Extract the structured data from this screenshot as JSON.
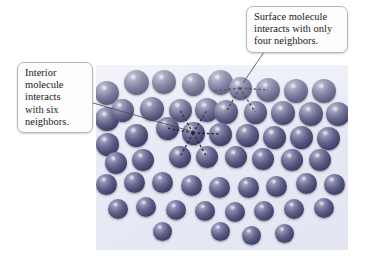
{
  "figure": {
    "background_color": "#ffffff",
    "panel": {
      "background_color": "#e8eaf4",
      "x": 96,
      "y": 65,
      "width": 252,
      "height": 185
    },
    "molecule": {
      "color": "#4a4c73",
      "highlight_color": "#b9bbd2",
      "shape": "sphere"
    }
  },
  "callouts": [
    {
      "id": "surface",
      "name": "surface-molecule-callout",
      "lines": [
        "Surface molecule",
        "interacts with only",
        "four neighbors."
      ],
      "text": "Surface molecule interacts with only four neighbors.",
      "neighbor_count": 4,
      "border_color": "#b9b9bd",
      "background_color": "#fdfdfd"
    },
    {
      "id": "interior",
      "name": "interior-molecule-callout",
      "lines": [
        "Interior",
        "molecule",
        "interacts",
        "with six",
        "neighbors."
      ],
      "text": "Interior molecule interacts with six neighbors.",
      "neighbor_count": 6,
      "border_color": "#b9b9bd",
      "background_color": "#fdfdfd"
    }
  ],
  "chart_data": {
    "type": "scatter",
    "xlabel": "",
    "ylabel": "",
    "grid": false,
    "legend": "none",
    "xlim": [
      0,
      252
    ],
    "ylim": [
      0,
      185
    ],
    "marker": "filled-sphere",
    "marker_color": "#4a4c73",
    "annotations": [
      {
        "label": "Surface molecule interacts with only four neighbors.",
        "target": [
          144,
          23
        ],
        "neighbors": 4
      },
      {
        "label": "Interior molecule interacts with six neighbors.",
        "target": [
          97,
          68
        ],
        "neighbors": 6
      }
    ],
    "highlighted_points": [
      {
        "role": "surface",
        "x": 144,
        "y": 23,
        "r": 11.5,
        "bonds": 4
      },
      {
        "role": "interior",
        "x": 97,
        "y": 68,
        "r": 11.5,
        "bonds": 6
      }
    ],
    "bonds": [
      {
        "from": [
          144,
          23
        ],
        "to": [
          117,
          26
        ]
      },
      {
        "from": [
          144,
          23
        ],
        "to": [
          172,
          25
        ]
      },
      {
        "from": [
          144,
          23
        ],
        "to": [
          130,
          47
        ]
      },
      {
        "from": [
          144,
          23
        ],
        "to": [
          159,
          47
        ]
      },
      {
        "from": [
          97,
          68
        ],
        "to": [
          71,
          63
        ]
      },
      {
        "from": [
          97,
          68
        ],
        "to": [
          124,
          69
        ]
      },
      {
        "from": [
          97,
          68
        ],
        "to": [
          84,
          45
        ]
      },
      {
        "from": [
          97,
          68
        ],
        "to": [
          111,
          45
        ]
      },
      {
        "from": [
          97,
          68
        ],
        "to": [
          84,
          92
        ]
      },
      {
        "from": [
          97,
          68
        ],
        "to": [
          111,
          92
        ]
      }
    ],
    "points": [
      {
        "x": 11,
        "y": 28,
        "r": 12
      },
      {
        "x": 40,
        "y": 17,
        "r": 12.5
      },
      {
        "x": 68,
        "y": 17,
        "r": 12
      },
      {
        "x": 97,
        "y": 19,
        "r": 11.5
      },
      {
        "x": 124,
        "y": 17,
        "r": 12.5
      },
      {
        "x": 144,
        "y": 23,
        "r": 11.5
      },
      {
        "x": 172,
        "y": 25,
        "r": 12
      },
      {
        "x": 200,
        "y": 26,
        "r": 12
      },
      {
        "x": 228,
        "y": 26,
        "r": 12
      },
      {
        "x": 11,
        "y": 54,
        "r": 12
      },
      {
        "x": 26,
        "y": 45,
        "r": 11.5
      },
      {
        "x": 56,
        "y": 44,
        "r": 12
      },
      {
        "x": 84,
        "y": 45,
        "r": 11.5
      },
      {
        "x": 111,
        "y": 45,
        "r": 12
      },
      {
        "x": 130,
        "y": 47,
        "r": 12
      },
      {
        "x": 159,
        "y": 47,
        "r": 11.5
      },
      {
        "x": 187,
        "y": 48,
        "r": 12
      },
      {
        "x": 215,
        "y": 49,
        "r": 12
      },
      {
        "x": 242,
        "y": 49,
        "r": 12
      },
      {
        "x": 11,
        "y": 79,
        "r": 11.5
      },
      {
        "x": 40,
        "y": 70,
        "r": 11.5
      },
      {
        "x": 71,
        "y": 63,
        "r": 11.5
      },
      {
        "x": 97,
        "y": 68,
        "r": 11.5
      },
      {
        "x": 124,
        "y": 69,
        "r": 11.5
      },
      {
        "x": 151,
        "y": 70,
        "r": 11.5
      },
      {
        "x": 178,
        "y": 72,
        "r": 11.5
      },
      {
        "x": 205,
        "y": 72,
        "r": 11.5
      },
      {
        "x": 232,
        "y": 73,
        "r": 11.5
      },
      {
        "x": 20,
        "y": 98,
        "r": 11
      },
      {
        "x": 47,
        "y": 95,
        "r": 11
      },
      {
        "x": 84,
        "y": 92,
        "r": 11
      },
      {
        "x": 111,
        "y": 92,
        "r": 11
      },
      {
        "x": 140,
        "y": 92,
        "r": 11
      },
      {
        "x": 167,
        "y": 94,
        "r": 11
      },
      {
        "x": 196,
        "y": 95,
        "r": 11
      },
      {
        "x": 224,
        "y": 95,
        "r": 11
      },
      {
        "x": 10,
        "y": 119,
        "r": 10.5
      },
      {
        "x": 38,
        "y": 117,
        "r": 10.5
      },
      {
        "x": 66,
        "y": 117,
        "r": 10.5
      },
      {
        "x": 95,
        "y": 120,
        "r": 10.5
      },
      {
        "x": 123,
        "y": 122,
        "r": 10.5
      },
      {
        "x": 152,
        "y": 122,
        "r": 10.5
      },
      {
        "x": 180,
        "y": 121,
        "r": 10.5
      },
      {
        "x": 210,
        "y": 118,
        "r": 10.5
      },
      {
        "x": 238,
        "y": 119,
        "r": 10.5
      },
      {
        "x": 22,
        "y": 144,
        "r": 10
      },
      {
        "x": 50,
        "y": 142,
        "r": 10
      },
      {
        "x": 80,
        "y": 145,
        "r": 10
      },
      {
        "x": 109,
        "y": 146,
        "r": 10
      },
      {
        "x": 139,
        "y": 147,
        "r": 10
      },
      {
        "x": 168,
        "y": 146,
        "r": 10
      },
      {
        "x": 198,
        "y": 144,
        "r": 10
      },
      {
        "x": 228,
        "y": 143,
        "r": 10
      },
      {
        "x": 66,
        "y": 166,
        "r": 9.5
      },
      {
        "x": 124,
        "y": 166,
        "r": 9.5
      },
      {
        "x": 155,
        "y": 170,
        "r": 9.5
      },
      {
        "x": 188,
        "y": 168,
        "r": 9.5
      }
    ]
  }
}
